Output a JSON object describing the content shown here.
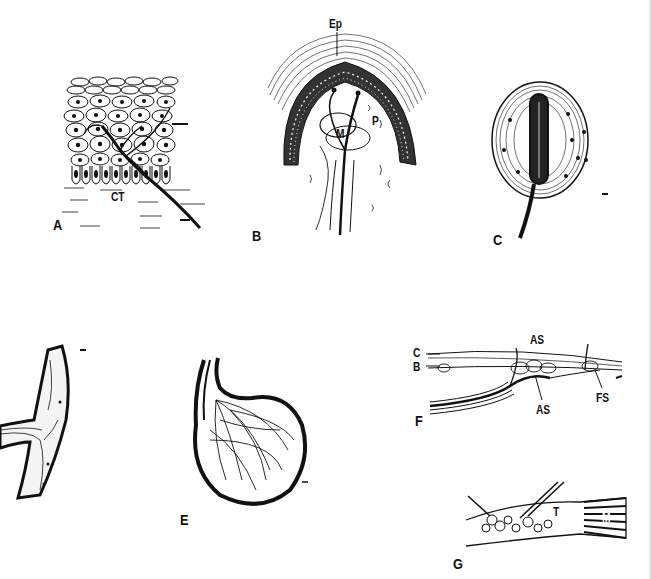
{
  "figure": {
    "title": "",
    "panels": [
      {
        "id": "A",
        "label": "A",
        "description": "Epithelium with intraepithelial nerve fibers over connective tissue",
        "annotations": [
          {
            "text": "CT",
            "meaning": "connective tissue"
          }
        ],
        "arrow": true
      },
      {
        "id": "B",
        "label": "B",
        "description": "Papilla covered by epithelium containing nerve ending",
        "annotations": [
          {
            "text": "Ep"
          },
          {
            "text": "M"
          },
          {
            "text": "P"
          }
        ]
      },
      {
        "id": "C",
        "label": "C",
        "description": "Encapsulated lamellated corpuscle with central fiber",
        "annotations": []
      },
      {
        "id": "D",
        "label": "",
        "description": "Partial encapsulated ending (cropped at left edge)",
        "annotations": []
      },
      {
        "id": "E",
        "label": "E",
        "description": "Spherical encapsulated ending with branching fibers",
        "annotations": []
      },
      {
        "id": "F",
        "label": "F",
        "description": "Longitudinal section of spindle ending",
        "annotations": [
          {
            "text": "C"
          },
          {
            "text": "B"
          },
          {
            "text": "AS"
          },
          {
            "text": "AS"
          },
          {
            "text": "FS"
          }
        ]
      },
      {
        "id": "G",
        "label": "G",
        "description": "Tendon organ at musculotendinous junction",
        "annotations": [
          {
            "text": "T"
          },
          {
            "text": "M"
          }
        ]
      }
    ]
  },
  "colors": {
    "ink": "#111111",
    "background": "#ffffff"
  }
}
